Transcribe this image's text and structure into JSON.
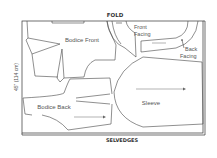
{
  "diagram": {
    "fold_label": "FOLD",
    "selvedge_label": "SELVEDGES",
    "width_label": "45\" (114 cm)",
    "pieces": [
      {
        "name": "Bodice Front",
        "label": "Bodice Front"
      },
      {
        "name": "Front Facing",
        "label_line1": "Front",
        "label_line2": "Facing"
      },
      {
        "name": "Back Facing",
        "label_line1": "Back",
        "label_line2": "Facing"
      },
      {
        "name": "Bodice Back",
        "label": "Bodice Back"
      },
      {
        "name": "Sleeve",
        "label": "Sleeve"
      }
    ],
    "colors": {
      "line": "#444444",
      "text": "#555555",
      "background": "#ffffff"
    }
  }
}
